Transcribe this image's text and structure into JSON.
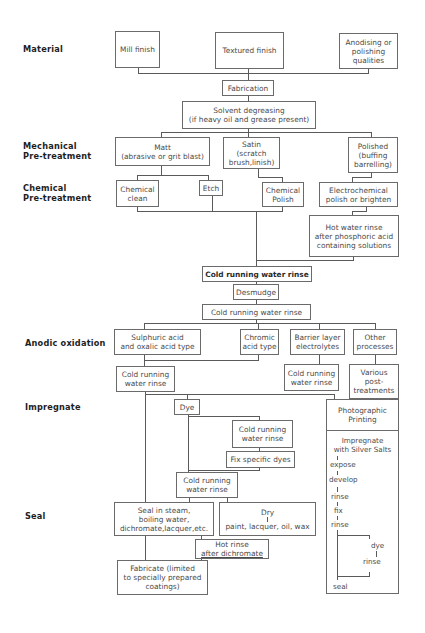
{
  "stages": {
    "material": "Material",
    "mechanical": [
      "Mechanical",
      "Pre-treatment"
    ],
    "chemical": [
      "Chemical",
      "Pre-treatment"
    ],
    "anodic": "Anodic oxidation",
    "impregnate": "Impregnate",
    "seal": "Seal"
  },
  "material": {
    "mill": "Mill finish",
    "textured": "Textured finish",
    "anodising": [
      "Anodising or",
      "polishing",
      "qualities"
    ]
  },
  "fabrication": "Fabrication",
  "degreasing": [
    "Solvent degreasing",
    "(if heavy oil and grease present)"
  ],
  "mechanical": {
    "matt": [
      "Matt",
      "(abrasive or grit blast)"
    ],
    "satin": [
      "Satin",
      "(scratch",
      "brush,linish)"
    ],
    "polished": [
      "Polished",
      "(buffing",
      "barrelling)"
    ]
  },
  "chemical": {
    "clean": [
      "Chemical",
      "clean"
    ],
    "etch": "Etch",
    "polish": [
      "Chemical",
      "Polish"
    ],
    "electro": [
      "Electrochemical",
      "polish or brighten"
    ],
    "hot_rinse": [
      "Hot water rinse",
      "after phosphoric acid",
      "containing solutions"
    ]
  },
  "rinse1": "Cold running water rinse",
  "desmudge": "Desmudge",
  "rinse2": "Cold running water rinse",
  "anodic": {
    "sulphuric": [
      "Sulphuric acid",
      "and oxalic acid type"
    ],
    "chromic": [
      "Chromic",
      "acid type"
    ],
    "barrier": [
      "Barrier layer",
      "electrolytes"
    ],
    "other": [
      "Other",
      "processes"
    ],
    "rinse_a": [
      "Cold running",
      "water rinse"
    ],
    "rinse_b": [
      "Cold running",
      "water rinse"
    ],
    "various": [
      "Various",
      "post-",
      "treatments"
    ]
  },
  "impregnate": {
    "dye": "Dye",
    "rinse_dye": [
      "Cold running",
      "water rinse"
    ],
    "fix": "Fix specific dyes",
    "rinse_after": [
      "Cold running",
      "water rinse"
    ]
  },
  "photo": {
    "title": [
      "Photographic",
      "Printing"
    ],
    "steps": [
      "Impregnate",
      "with Silver Salts",
      "expose",
      "develop",
      "rinse",
      "fix",
      "rinse",
      "dye",
      "rinse",
      "seal"
    ]
  },
  "seal": {
    "seal_in": [
      "Seal in steam,",
      "boiling water,",
      "dichromate,lacquer,etc."
    ],
    "dry": [
      "Dry",
      "paint, lacquer, oil, wax"
    ],
    "hot_rinse": [
      "Hot rinse",
      "after dichromate"
    ],
    "fabricate": [
      "Fabricate (limited",
      "to specially prepared",
      "coatings)"
    ]
  }
}
